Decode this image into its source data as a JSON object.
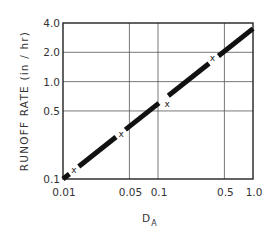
{
  "chart_data": {
    "type": "line",
    "title": "",
    "xlabel": "D",
    "xlabel_subscript": "A",
    "ylabel": "RUNOFF RATE (in / hr)",
    "x_scale": "log",
    "y_scale": "log",
    "xlim": [
      0.01,
      1.0
    ],
    "ylim": [
      0.1,
      4.0
    ],
    "x_ticks": [
      0.01,
      0.05,
      0.1,
      0.5,
      1.0
    ],
    "x_tick_labels": [
      "0.01",
      "0.05",
      "0.1",
      "0.5",
      "1.0"
    ],
    "y_ticks": [
      0.1,
      0.5,
      1.0,
      2.0,
      4.0
    ],
    "y_tick_labels": [
      "0.1",
      "0.5",
      "1.0",
      "2.0",
      "4.0"
    ],
    "grid": true,
    "legend": null,
    "series": [
      {
        "name": "fitted line",
        "style": "thick solid black line",
        "x": [
          0.01,
          1.0
        ],
        "y": [
          0.1,
          3.5
        ]
      },
      {
        "name": "observed points",
        "marker": "x",
        "x": [
          0.013,
          0.041,
          0.125,
          0.375
        ],
        "y": [
          0.124,
          0.29,
          0.59,
          1.74
        ]
      }
    ]
  },
  "plot_area": {
    "left": 63,
    "right": 253,
    "top": 23,
    "bottom": 179
  },
  "marker_symbol": "x"
}
